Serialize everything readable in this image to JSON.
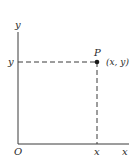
{
  "diagram": {
    "type": "cartesian-point",
    "axes": {
      "x_label": "x",
      "y_label": "y",
      "origin_label": "O"
    },
    "point": {
      "name": "P",
      "coords_label": "(x, y)",
      "x_tick_label": "x",
      "y_tick_label": "y"
    },
    "colors": {
      "ink": "#2a2a2a",
      "background": "#ffffff"
    }
  }
}
